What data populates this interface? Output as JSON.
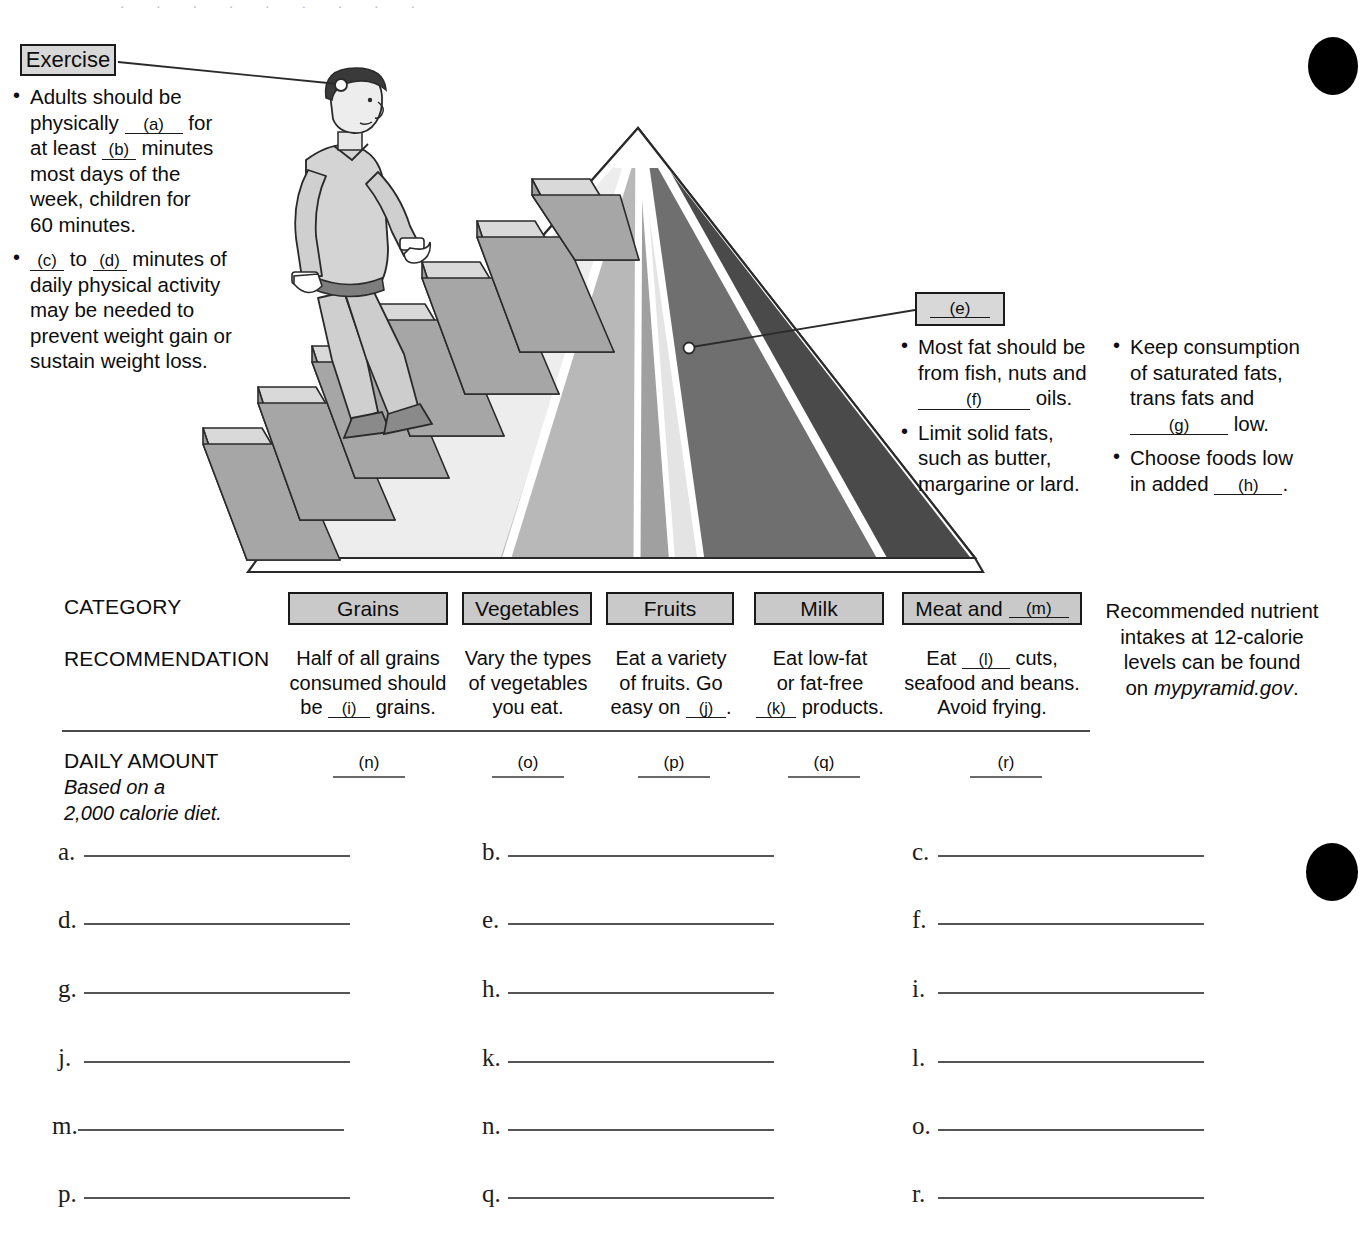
{
  "exercise_callout": {
    "label": "Exercise",
    "bullets": [
      "Adults should be physically (a) for at least (b) minutes most days of the week, children for 60 minutes.",
      "(c) to (d) minutes of daily physical activity may be needed to prevent weight gain or sustain weight loss."
    ],
    "b1_t1": "Adults should be",
    "b1_t2": "physically",
    "b1_blank_a": "(a)",
    "b1_t3": "for",
    "b1_t4": "at least",
    "b1_blank_b": "(b)",
    "b1_t5": "minutes",
    "b1_t6": "most days of the",
    "b1_t7": "week, children for",
    "b1_t8": "60 minutes.",
    "b2_blank_c": "(c)",
    "b2_t1": "to",
    "b2_blank_d": "(d)",
    "b2_t2": "minutes of",
    "b2_t3": "daily physical activity",
    "b2_t4": "may be needed to",
    "b2_t5": "prevent weight gain or",
    "b2_t6": "sustain weight loss."
  },
  "fats_callout": {
    "label_blank": "(e)",
    "col1": {
      "b1_t1": "Most fat should be",
      "b1_t2": "from fish, nuts and",
      "b1_blank_f": "(f)",
      "b1_t3": "oils.",
      "b2_t1": "Limit solid fats,",
      "b2_t2": "such as butter,",
      "b2_t3": "margarine or lard."
    },
    "col2": {
      "b1_t1": "Keep consumption",
      "b1_t2": "of saturated fats,",
      "b1_t3": "trans fats and",
      "b1_blank_g": "(g)",
      "b1_t4": "low.",
      "b2_t1": "Choose foods low",
      "b2_t2": "in added",
      "b2_blank_h": "(h)",
      "b2_t3": "."
    }
  },
  "table": {
    "row_labels": {
      "category": "CATEGORY",
      "recommendation": "RECOMMENDATION"
    },
    "categories": [
      {
        "name": "Grains",
        "blank": ""
      },
      {
        "name": "Vegetables",
        "blank": ""
      },
      {
        "name": "Fruits",
        "blank": ""
      },
      {
        "name": "Milk",
        "blank": ""
      },
      {
        "name": "Meat and",
        "blank": "(m)"
      }
    ],
    "recommendations": [
      {
        "l1": "Half of all grains",
        "l2": "consumed should",
        "l3a": "be",
        "l3_blank": "(i)",
        "l3b": "grains."
      },
      {
        "l1": "Vary the types",
        "l2": "of vegetables",
        "l3a": "you eat.",
        "l3_blank": "",
        "l3b": ""
      },
      {
        "l1": "Eat a variety",
        "l2": "of fruits. Go",
        "l3a": "easy on",
        "l3_blank": "(j)",
        "l3b": "."
      },
      {
        "l1": "Eat low-fat",
        "l2": "or fat-free",
        "l3a": "",
        "l3_blank": "(k)",
        "l3b": "products."
      },
      {
        "l1a": "Eat",
        "l1_blank": "(l)",
        "l1b": "cuts,",
        "l2": "seafood and beans.",
        "l3a": "Avoid frying.",
        "l3_blank": "",
        "l3b": ""
      }
    ],
    "side_note": {
      "l1": "Recommended nutrient",
      "l2": "intakes at 12-calorie",
      "l3": "levels can be found",
      "l4a": "on ",
      "l4_italic": "mypyramid.gov",
      "l4b": "."
    },
    "daily_amount": {
      "title": "DAILY AMOUNT",
      "sub1": "Based on a",
      "sub2": "2,000 calorie diet.",
      "blanks": [
        "(n)",
        "(o)",
        "(p)",
        "(q)",
        "(r)"
      ]
    }
  },
  "answer_blanks": [
    "a.",
    "b.",
    "c.",
    "d.",
    "e.",
    "f.",
    "g.",
    "h.",
    "i.",
    "j.",
    "k.",
    "l.",
    "m.",
    "n.",
    "o.",
    "p.",
    "q.",
    "r."
  ],
  "colors": {
    "callout_fill": "#d8d8d8",
    "category_fill": "#c9c9c9",
    "ink": "#0d0d0d",
    "rule": "#4a4a4a",
    "band_grains": "#e8e8e8",
    "band_vegetables": "#bcbcbc",
    "band_fruits": "#a2a2a2",
    "band_oils": "#d4d4d4",
    "band_milk": "#707070",
    "band_meat": "#4f4f4f",
    "stairs_tread": "#d9d9d9",
    "stairs_riser": "#a8a8a8"
  },
  "graphic": {
    "name": "mypyramid-diagram",
    "person_label": "person-climbing-stairs",
    "bands": [
      "Grains",
      "Vegetables",
      "Fruits",
      "Oils",
      "Milk",
      "Meat and Beans"
    ]
  }
}
